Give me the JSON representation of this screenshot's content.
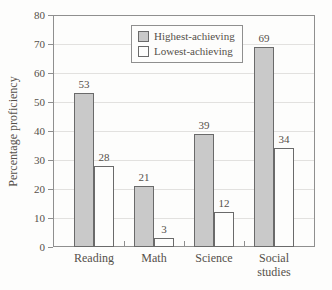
{
  "figure": {
    "background": "#fdfdfc",
    "text_color": "#55504a"
  },
  "chart_data": {
    "type": "bar",
    "title": "",
    "xlabel": "",
    "ylabel": "Percentage proficiency",
    "categories": [
      "Reading",
      "Math",
      "Science",
      "Social studies"
    ],
    "series": [
      {
        "name": "Highest-achieving",
        "values": [
          53,
          21,
          39,
          69
        ],
        "fill": "#c9c9c9"
      },
      {
        "name": "Lowest-achieving",
        "values": [
          28,
          3,
          12,
          34
        ],
        "fill": "#fdfdfc"
      }
    ],
    "ylim": [
      0,
      80
    ],
    "yticks": [
      0,
      10,
      20,
      30,
      40,
      50,
      60,
      70,
      80
    ],
    "grid": true,
    "bar_labels": true,
    "legend_position": "top-center"
  },
  "colors": {
    "bar_stroke": "#6a6a6a",
    "frame": "#8f8f8f",
    "grid": "#e2e1df",
    "text": "#55504a"
  }
}
